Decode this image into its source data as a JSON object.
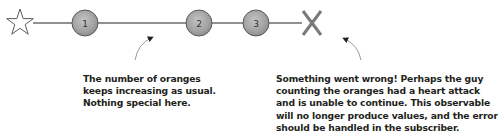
{
  "timeline": {
    "start_symbol": "star",
    "end_symbol": "X",
    "marbles": [
      {
        "label": "1",
        "x": 85
      },
      {
        "label": "2",
        "x": 199
      },
      {
        "label": "3",
        "x": 256
      }
    ],
    "colors": {
      "line": "#6d6d6d",
      "marble_fill": "#a6a6a6",
      "marble_stroke": "#5a5a5a",
      "error_x": "#7a7a7a",
      "text": "#231f20"
    }
  },
  "annotations": {
    "left": {
      "lines": [
        "The number of oranges",
        "keeps increasing as usual.",
        "Nothing special here."
      ]
    },
    "right": {
      "lines": [
        "Something went wrong! Perhaps the guy",
        "counting the oranges had a heart attack",
        "and is unable to continue. This observable",
        "will no longer produce values, and the error",
        "should be handled in the subscriber."
      ]
    }
  }
}
